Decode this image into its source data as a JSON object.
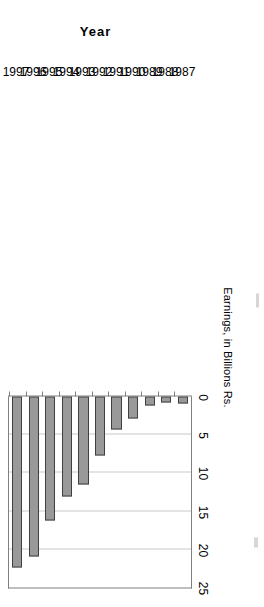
{
  "chart_data": {
    "type": "bar",
    "orientation": "vertical",
    "title": "",
    "subtitle": "",
    "xlabel": "Year",
    "ylabel": "Earnings, in Billions Rs.",
    "categories": [
      "1987",
      "1988",
      "1989",
      "1990",
      "1991",
      "1992",
      "1993",
      "1994",
      "1995",
      "1996",
      "1997"
    ],
    "values": [
      0.9,
      0.8,
      1.2,
      2.9,
      4.3,
      7.7,
      11.5,
      13.1,
      16.2,
      20.9,
      22.4
    ],
    "series": [
      {
        "name": "Earnings",
        "values": [
          0.9,
          0.8,
          1.2,
          2.9,
          4.3,
          7.7,
          11.5,
          13.1,
          16.2,
          20.9,
          22.4
        ]
      }
    ],
    "ylim": [
      0,
      25
    ],
    "yticks": [
      0,
      5,
      10,
      15,
      20,
      25
    ],
    "ytick_labels": [
      "0",
      "5",
      "10",
      "15",
      "20",
      "25"
    ],
    "grid": true,
    "grid_axis": "value",
    "legend": false,
    "legend_position": "none",
    "bar_fill_color": "#999999",
    "bar_border_color": "#404040",
    "gridline_color": "#c9c9c9",
    "axis_color": "#808080",
    "plot_background": "#ffffff",
    "rotation_degrees": -90,
    "annotations": []
  },
  "axes": {
    "value_axis": {
      "title": "Earnings, in Billions Rs.",
      "ticks": [
        "0",
        "5",
        "10",
        "15",
        "20",
        "25"
      ]
    },
    "category_axis": {
      "title": "Year",
      "ticks": [
        "1987",
        "1988",
        "1989",
        "1990",
        "1991",
        "1992",
        "1993",
        "1994",
        "1995",
        "1996",
        "1997"
      ]
    }
  }
}
